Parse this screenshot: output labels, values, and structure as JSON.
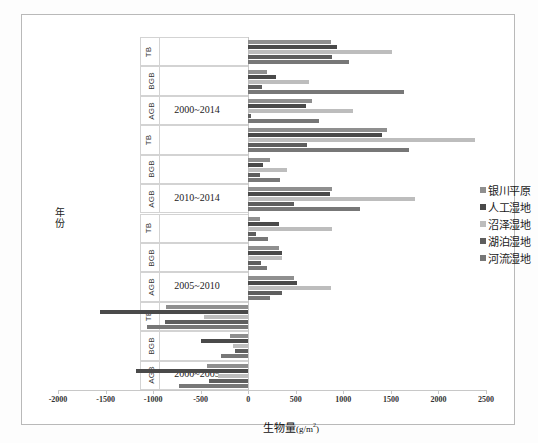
{
  "chart_data": {
    "type": "bar",
    "orientation": "horizontal",
    "title": "",
    "xlabel": "生物量(g/m2)",
    "xlabel_main": "生物量",
    "xlabel_unit_open": "(g/m",
    "xlabel_unit_sup": "2",
    "xlabel_unit_close": ")",
    "ylabel": "年份",
    "ylabel_chars": [
      "年",
      "份"
    ],
    "xlim": [
      -2000,
      2500
    ],
    "xticks": [
      -2000,
      -1500,
      -1000,
      -500,
      0,
      500,
      1000,
      1500,
      2000,
      2500
    ],
    "xtick_labels": [
      "-2000",
      "-1500",
      "-1000",
      "-500",
      "0",
      "500",
      "1000",
      "1500",
      "2000",
      "2500"
    ],
    "grid": false,
    "legend_position": "right",
    "series": [
      {
        "name": "银川平原",
        "color": "#8f8f8f"
      },
      {
        "name": "人工湿地",
        "color": "#4a4a4a"
      },
      {
        "name": "沼泽湿地",
        "color": "#bdbdbd"
      },
      {
        "name": "湖泊湿地",
        "color": "#5e5e5e"
      },
      {
        "name": "河流湿地",
        "color": "#777777"
      }
    ],
    "groups": [
      {
        "period": "2000~2014",
        "subgroups": [
          {
            "name": "TB",
            "values": [
              870,
              930,
              1510,
              880,
              1060
            ]
          },
          {
            "name": "BGB",
            "values": [
              200,
              290,
              640,
              140,
              1640
            ]
          },
          {
            "name": "AGB",
            "values": [
              670,
              610,
              1100,
              30,
              740
            ]
          }
        ]
      },
      {
        "period": "2010~2014",
        "subgroups": [
          {
            "name": "TB",
            "values": [
              1460,
              1410,
              2380,
              620,
              1690
            ]
          },
          {
            "name": "BGB",
            "values": [
              230,
              160,
              410,
              120,
              330
            ]
          },
          {
            "name": "AGB",
            "values": [
              880,
              860,
              1750,
              480,
              1180
            ]
          }
        ]
      },
      {
        "period": "2005~2010",
        "subgroups": [
          {
            "name": "TB",
            "values": [
              120,
              320,
              880,
              80,
              210
            ]
          },
          {
            "name": "BGB",
            "values": [
              320,
              350,
              360,
              130,
              200
            ]
          },
          {
            "name": "AGB",
            "values": [
              480,
              510,
              870,
              350,
              230
            ]
          }
        ]
      },
      {
        "period": "2000~2005",
        "subgroups": [
          {
            "name": "TB",
            "values": [
              -860,
              -1560,
              -460,
              -870,
              -1060
            ]
          },
          {
            "name": "BGB",
            "values": [
              -190,
              -500,
              -160,
              -140,
              -290
            ]
          },
          {
            "name": "AGB",
            "values": [
              -430,
              -1180,
              -320,
              -410,
              -730
            ]
          }
        ]
      }
    ]
  }
}
